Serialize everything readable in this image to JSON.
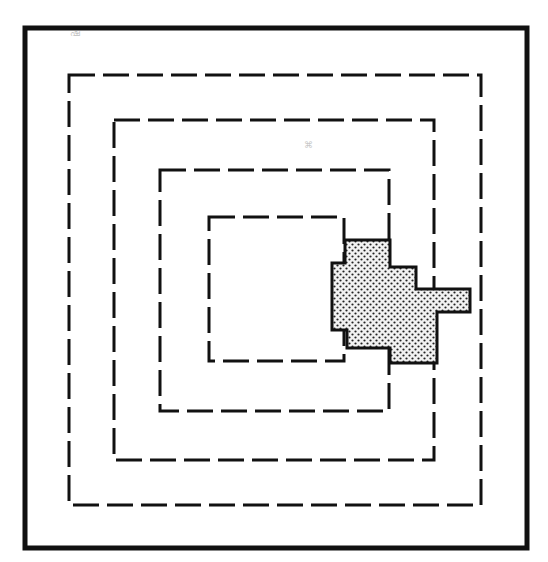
{
  "diagram": {
    "colors": {
      "ink": "#111111",
      "background": "#ffffff",
      "shade_dot": "#222222",
      "shade_bg": "#f2f2f2"
    },
    "outer_frame": {
      "x": 25,
      "y": 28,
      "w": 502,
      "h": 520,
      "stroke": 5
    },
    "zones": [
      {
        "id": "zone-1",
        "x": 69,
        "y": 75,
        "w": 412,
        "h": 430
      },
      {
        "id": "zone-2",
        "x": 114,
        "y": 120,
        "w": 320,
        "h": 340
      },
      {
        "id": "zone-3",
        "x": 160,
        "y": 170,
        "w": 229,
        "h": 241
      },
      {
        "id": "zone-4",
        "x": 209,
        "y": 217,
        "w": 135,
        "h": 144
      }
    ],
    "shaded_region": {
      "points": "345,240 390,240 390,267 416,267 416,289 470,289 470,312 437,312 437,363 390,363 390,348 347,348 347,330 332,330 332,263 345,263"
    },
    "stray_marks": [
      {
        "x": 70,
        "y": 36,
        "text": "ഷ"
      },
      {
        "x": 304,
        "y": 148,
        "text": "⌘"
      }
    ]
  }
}
